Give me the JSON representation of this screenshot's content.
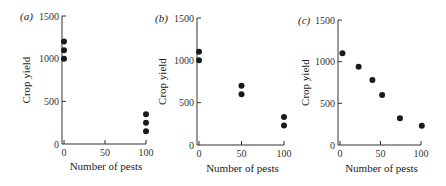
{
  "chart_data": [
    {
      "type": "scatter",
      "panel_label": "(a)",
      "xlabel": "Number of pests",
      "ylabel": "Crop yield",
      "xlim": [
        0,
        100
      ],
      "ylim": [
        0,
        1500
      ],
      "x_ticks": [
        "0",
        "50",
        "100"
      ],
      "y_ticks": [
        "0",
        "500",
        "1000",
        "1500"
      ],
      "grid": false,
      "points": [
        {
          "x": 0,
          "y": 1200
        },
        {
          "x": 0,
          "y": 1100
        },
        {
          "x": 0,
          "y": 1000
        },
        {
          "x": 100,
          "y": 350
        },
        {
          "x": 100,
          "y": 250
        },
        {
          "x": 100,
          "y": 150
        }
      ]
    },
    {
      "type": "scatter",
      "panel_label": "(b)",
      "xlabel": "Number of pests",
      "ylabel": "Crop yield",
      "xlim": [
        0,
        100
      ],
      "ylim": [
        0,
        1500
      ],
      "x_ticks": [
        "0",
        "50",
        "100"
      ],
      "y_ticks": [
        "0",
        "500",
        "1000",
        "1500"
      ],
      "grid": false,
      "points": [
        {
          "x": 0,
          "y": 1100
        },
        {
          "x": 0,
          "y": 1000
        },
        {
          "x": 50,
          "y": 700
        },
        {
          "x": 50,
          "y": 600
        },
        {
          "x": 100,
          "y": 330
        },
        {
          "x": 100,
          "y": 230
        }
      ]
    },
    {
      "type": "scatter",
      "panel_label": "(c)",
      "xlabel": "Number of pests",
      "ylabel": "Crop yield",
      "xlim": [
        0,
        100
      ],
      "ylim": [
        0,
        1500
      ],
      "x_ticks": [
        "0",
        "50",
        "100"
      ],
      "y_ticks": [
        "0",
        "500",
        "1000",
        "1500"
      ],
      "grid": false,
      "points": [
        {
          "x": 3,
          "y": 1100
        },
        {
          "x": 23,
          "y": 940
        },
        {
          "x": 40,
          "y": 780
        },
        {
          "x": 52,
          "y": 600
        },
        {
          "x": 74,
          "y": 320
        },
        {
          "x": 101,
          "y": 230
        }
      ]
    }
  ],
  "colors": {
    "axis": "#333333",
    "point": "#1a1a1a"
  }
}
